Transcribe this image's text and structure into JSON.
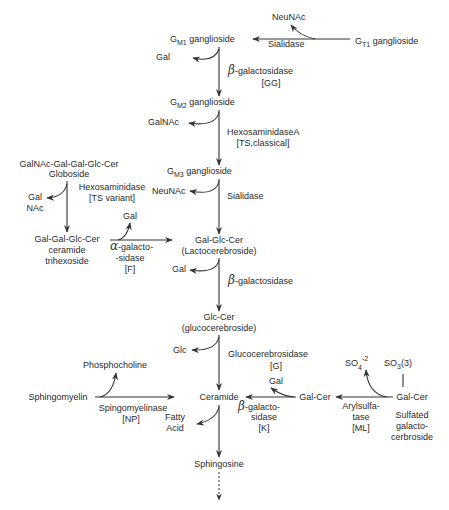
{
  "nodes": {
    "gt1": {
      "base": "G",
      "sub": "T1",
      "rest": " ganglioside"
    },
    "gm1": {
      "base": "G",
      "sub": "M1",
      "rest": " ganglioside"
    },
    "gm2": {
      "base": "G",
      "sub": "M2",
      "rest": " ganglioside"
    },
    "gm3": {
      "base": "G",
      "sub": "M3",
      "rest": " ganglioside"
    },
    "globoside": {
      "line1": "GalNAc-Gal-Gal-Glc-Cer",
      "line2": "Globoside"
    },
    "ceramide_trihexoside": {
      "line1": "Gal-Gal-Glc-Cer",
      "line2": "ceramide",
      "line3": "trihexoside"
    },
    "lactocerebroside": {
      "line1": "Gal-Glc-Cer",
      "line2": "(Lactocerebroside)"
    },
    "glucocerebroside": {
      "line1": "Glc-Cer",
      "line2": "(glucocerebroside)"
    },
    "ceramide": "Ceramide",
    "sphingomyelin": "Sphingomyelin",
    "sphingosine": "Sphingosine",
    "galcer": "Gal-Cer",
    "sulfated_galcer": {
      "line1": "Gal-Cer",
      "line2": "Sulfated",
      "line3": "galacto-",
      "line4": "cerbroside"
    }
  },
  "products": {
    "neunac_top": "NeuNAc",
    "gal_gm1": "Gal",
    "galnac_gm2": "GalNAc",
    "neunac_gm3": "NeuNAc",
    "galnac_globo_1": "Gal",
    "galnac_globo_2": "NAc",
    "gal_trihex": "Gal",
    "gal_lacto": "Gal",
    "glc": "Glc",
    "phosphocholine": "Phosphocholine",
    "fatty_acid_1": "Fatty",
    "fatty_acid_2": "Acid",
    "gal_galcer": "Gal",
    "so4_base": "SO",
    "so4_sub": "4",
    "so4_sup": "-2",
    "so3_base": "SO",
    "so3_sub": "3",
    "so3_rest": "(3)"
  },
  "enzymes": {
    "sialidase_top": "Sialidase",
    "beta_gal_gm1_greek": "β",
    "beta_gal_gm1": "-galactosidase",
    "beta_gal_gm1_disease": "[GG]",
    "hexA": "HexosaminidaseA",
    "hexA_disease": "[TS,classical]",
    "sialidase_gm3": "Sialidase",
    "hex_variant": "Hexosaminidase",
    "hex_variant_disease": "[TS variant]",
    "alpha_gal_greek": "α",
    "alpha_gal_1": "-galacto-",
    "alpha_gal_2": "-sidase",
    "alpha_gal_disease": "[F]",
    "beta_gal_lacto_greek": "β",
    "beta_gal_lacto": "-galactosidase",
    "glucocerebrosidase": "Glucocerebrosidase",
    "glucocerebrosidase_disease": "[G]",
    "sphingomyelinase": "Spingomyelinase",
    "sphingomyelinase_disease": "[NP]",
    "beta_gal_k_greek": "β",
    "beta_gal_k_1": "-galacto-",
    "beta_gal_k_2": "sidase",
    "beta_gal_k_disease": "[K]",
    "arylsulfatase_1": "Arylsulfa-",
    "arylsulfatase_2": "tase",
    "arylsulfatase_disease": "[ML]"
  }
}
